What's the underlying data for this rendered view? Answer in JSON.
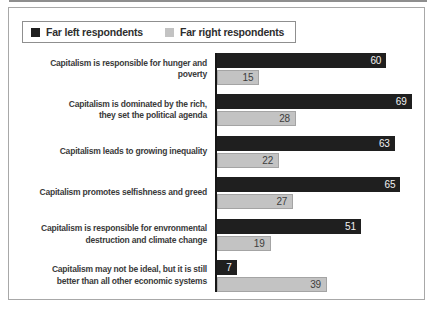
{
  "legend": {
    "items": [
      {
        "label": "Far left respondents",
        "color": "#1f1f1f"
      },
      {
        "label": "Far right respondents",
        "color": "#c3c3c3"
      }
    ]
  },
  "chart_data": {
    "type": "bar",
    "orientation": "horizontal",
    "title": "",
    "xlabel": "",
    "ylabel": "",
    "xlim": [
      0,
      72
    ],
    "grid": false,
    "legend_position": "top-left",
    "value_labels": "inside-end",
    "categories": [
      "Capitalism is responsible for hunger and poverty",
      "Capitalism is dominated by the rich,\nthey set the political agenda",
      "Capitalism leads to growing inequality",
      "Capitalism promotes selfishness and greed",
      "Capitalism is responsible for envronmental\ndestruction and climate change",
      "Capitalism may not be ideal, but it is still\nbetter than all other economic systems"
    ],
    "series": [
      {
        "name": "Far left respondents",
        "color": "#1f1f1f",
        "values": [
          60,
          69,
          63,
          65,
          51,
          7
        ]
      },
      {
        "name": "Far right respondents",
        "color": "#c3c3c3",
        "values": [
          15,
          28,
          22,
          27,
          19,
          39
        ]
      }
    ]
  }
}
